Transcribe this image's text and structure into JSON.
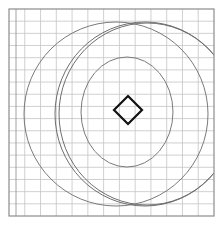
{
  "diagram": {
    "type": "geometric-figure-on-grid",
    "background": "#ffffff",
    "grid": {
      "frame": {
        "x": 9,
        "y": 9,
        "width": 205,
        "height": 207,
        "color": "#8c8c8c"
      },
      "inner_left_edge_x": 16,
      "columns": 13,
      "rows": 17,
      "line_color": "#c4c4c4"
    },
    "shapes": [
      {
        "kind": "ellipse",
        "name": "outer-ellipse",
        "cx": 116,
        "cy": 114,
        "rx": 92,
        "ry": 92,
        "color": "#7a7a7a"
      },
      {
        "kind": "ellipse",
        "name": "crescent-arc-a",
        "cx": 145,
        "cy": 114,
        "rx": 90,
        "ry": 92,
        "color": "#6e6e6e"
      },
      {
        "kind": "ellipse",
        "name": "crescent-arc-b",
        "cx": 147,
        "cy": 114,
        "rx": 88,
        "ry": 91,
        "color": "#6e6e6e"
      },
      {
        "kind": "ellipse",
        "name": "inner-ellipse",
        "cx": 127,
        "cy": 112,
        "rx": 46,
        "ry": 55,
        "color": "#7a7a7a"
      },
      {
        "kind": "diamond",
        "name": "center-diamond",
        "cx": 128,
        "cy": 110,
        "half_w": 14,
        "half_h": 14,
        "color": "#111111"
      }
    ]
  }
}
